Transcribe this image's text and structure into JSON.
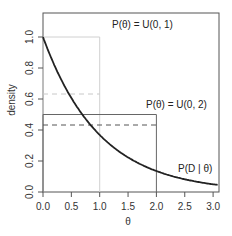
{
  "chart_data": {
    "type": "line",
    "title": "",
    "xlabel": "θ",
    "ylabel": "density",
    "xlim": [
      0,
      3.1
    ],
    "ylim": [
      0,
      1.15
    ],
    "x_ticks": [
      "0.0",
      "0.5",
      "1.0",
      "1.5",
      "2.0",
      "2.5",
      "3.0"
    ],
    "y_ticks": [
      "0.0",
      "0.2",
      "0.4",
      "0.6",
      "0.8",
      "1.0"
    ],
    "grid": false,
    "series": [
      {
        "name": "P(D | θ)",
        "style": "solid-dark",
        "x": [
          0,
          0.25,
          0.5,
          0.75,
          1.0,
          1.25,
          1.5,
          1.75,
          2.0,
          2.25,
          2.5,
          2.75,
          3.0,
          3.1
        ],
        "values": [
          1.0,
          0.779,
          0.607,
          0.472,
          0.368,
          0.287,
          0.223,
          0.174,
          0.135,
          0.105,
          0.082,
          0.064,
          0.05,
          0.045
        ]
      },
      {
        "name": "P(θ) = U(0, 1)",
        "style": "dotted-light-gray",
        "x": [
          0,
          0,
          1,
          1
        ],
        "values": [
          0,
          1,
          1,
          0
        ]
      },
      {
        "name": "P(θ) = U(0, 2)",
        "style": "solid-gray",
        "x": [
          0,
          0,
          2,
          2
        ],
        "values": [
          0,
          0.5,
          0.5,
          0
        ]
      },
      {
        "name": "mean likelihood under U(0,1)",
        "style": "dashed-light-gray",
        "x": [
          0,
          1
        ],
        "values": [
          0.632,
          0.632
        ]
      },
      {
        "name": "mean likelihood under U(0,2)",
        "style": "dashed-dark",
        "x": [
          0,
          2
        ],
        "values": [
          0.432,
          0.432
        ]
      }
    ],
    "annotations": [
      {
        "text": "P(θ) = U(0, 1)",
        "x": 1.5,
        "y": 1.08
      },
      {
        "text": "P(θ) = U(0, 2)",
        "x": 2.6,
        "y": 0.56
      },
      {
        "text": "P(D | θ)",
        "x": 2.8,
        "y": 0.14
      }
    ]
  },
  "labels": {
    "xlabel": "θ",
    "ylabel": "density",
    "anno_u01": "P(θ) = U(0, 1)",
    "anno_u02": "P(θ) = U(0, 2)",
    "anno_lik": "P(D | θ)"
  }
}
